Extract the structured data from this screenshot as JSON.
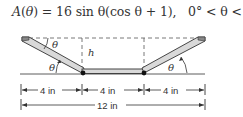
{
  "formula": {
    "lhs_func": "A",
    "lhs_arg": "θ",
    "rhs": "= 16 sin θ(cos θ + 1),",
    "domain": "0° < θ < 90°"
  },
  "diagram": {
    "angle_symbol": "θ",
    "height_label": "h",
    "segments": [
      {
        "label": "4 in"
      },
      {
        "label": "4 in"
      },
      {
        "label": "4 in"
      }
    ],
    "total_label": "12 in",
    "colors": {
      "stroke": "#333333",
      "fill": "#d9d9d9"
    }
  }
}
